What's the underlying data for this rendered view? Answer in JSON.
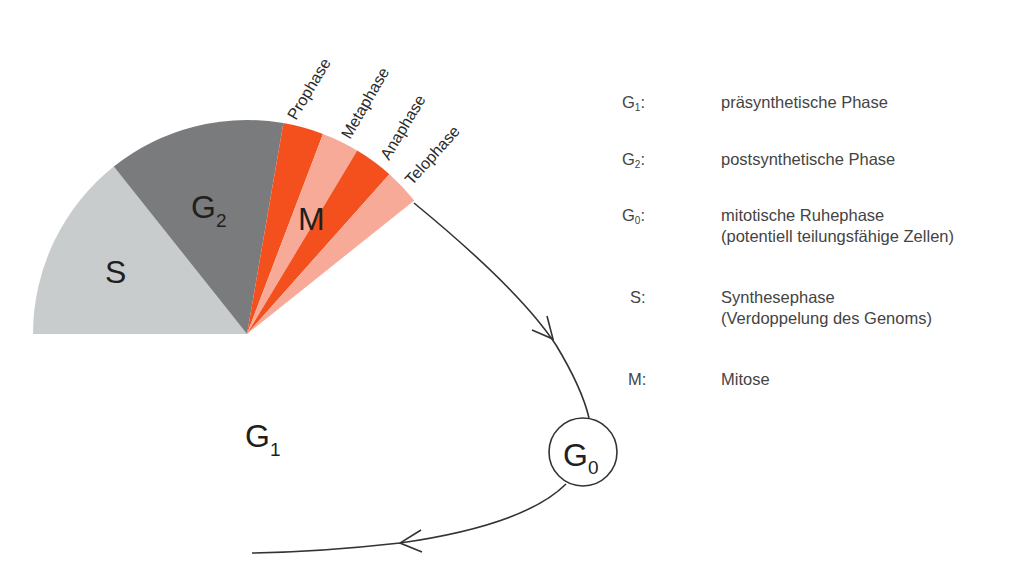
{
  "diagram": {
    "slices": [
      {
        "id": "S",
        "label": "S",
        "subscript": "",
        "start_deg": 180,
        "end_deg": 128.5,
        "color": "#c9cccd"
      },
      {
        "id": "G2",
        "label": "G",
        "subscript": "2",
        "start_deg": 128.5,
        "end_deg": 80.2,
        "color": "#7a7b7d"
      },
      {
        "id": "prophase",
        "label": "",
        "subscript": "",
        "start_deg": 80.2,
        "end_deg": 69.2,
        "color": "#f4501e"
      },
      {
        "id": "metaphase",
        "label": "",
        "subscript": "",
        "start_deg": 69.2,
        "end_deg": 59.0,
        "color": "#f7aa98"
      },
      {
        "id": "anaphase",
        "label": "",
        "subscript": "",
        "start_deg": 59.0,
        "end_deg": 48.3,
        "color": "#f4501e"
      },
      {
        "id": "telophase",
        "label": "",
        "subscript": "",
        "start_deg": 48.3,
        "end_deg": 38.6,
        "color": "#f7aa98"
      }
    ],
    "mitosis_label": "M",
    "phase_labels": [
      "Prophase",
      "Metaphase",
      "Anaphase",
      "Telophase"
    ],
    "g1_label": {
      "main": "G",
      "sub": "1"
    },
    "g0_label": {
      "main": "G",
      "sub": "0"
    }
  },
  "legend": [
    {
      "key": "G",
      "key_sub": "1",
      "lines": [
        "präsynthetische Phase"
      ]
    },
    {
      "key": "G",
      "key_sub": "2",
      "lines": [
        "postsynthetische Phase"
      ]
    },
    {
      "key": "G",
      "key_sub": "0",
      "lines": [
        "mitotische Ruhephase",
        "(potentiell teilungsfähige Zellen)"
      ]
    },
    {
      "key": "S",
      "key_sub": "",
      "lines": [
        "Synthesephase",
        "(Verdoppelung des Genoms)"
      ]
    },
    {
      "key": "M",
      "key_sub": "",
      "lines": [
        "Mitose"
      ]
    }
  ]
}
